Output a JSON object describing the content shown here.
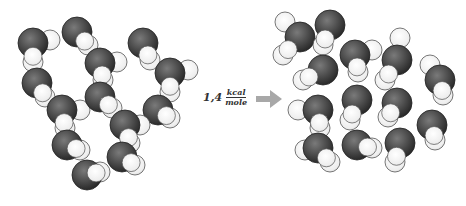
{
  "diagram": {
    "energy_label": {
      "coefficient": "1,4",
      "unit_numerator": "kcal",
      "unit_denominator": "mole"
    },
    "arrow_color": "#9a9a9a",
    "colors": {
      "oxygen_dark": "#3a3a3a",
      "oxygen_mid": "#6a6a6a",
      "hydrogen_fill": "#f2f2f2",
      "outline": "#555555"
    },
    "left_cluster": {
      "name": "ordered-structure",
      "molecules": [
        {
          "o": [
            33,
            43
          ],
          "h": [
            [
              50,
              40
            ],
            [
              33,
              62
            ]
          ]
        },
        {
          "o": [
            77,
            32
          ],
          "h": [
            [
              88,
              45
            ]
          ]
        },
        {
          "o": [
            100,
            63
          ],
          "h": [
            [
              117,
              62
            ],
            [
              103,
              80
            ]
          ]
        },
        {
          "o": [
            143,
            43
          ],
          "h": [
            [
              150,
              60
            ]
          ]
        },
        {
          "o": [
            170,
            73
          ],
          "h": [
            [
              188,
              70
            ],
            [
              170,
              92
            ]
          ]
        },
        {
          "o": [
            37,
            83
          ],
          "h": [
            [
              45,
              97
            ]
          ]
        },
        {
          "o": [
            62,
            110
          ],
          "h": [
            [
              80,
              110
            ],
            [
              65,
              128
            ]
          ]
        },
        {
          "o": [
            100,
            97
          ],
          "h": [
            [
              112,
              108
            ]
          ]
        },
        {
          "o": [
            158,
            110
          ],
          "h": [
            [
              170,
              118
            ]
          ]
        },
        {
          "o": [
            125,
            125
          ],
          "h": [
            [
              140,
              125
            ],
            [
              130,
              143
            ]
          ]
        },
        {
          "o": [
            67,
            145
          ],
          "h": [
            [
              80,
              150
            ]
          ]
        },
        {
          "o": [
            122,
            157
          ],
          "h": [
            [
              135,
              165
            ]
          ]
        },
        {
          "o": [
            87,
            175
          ],
          "h": [
            [
              100,
              172
            ]
          ]
        }
      ]
    },
    "right_cluster": {
      "name": "disordered-structure",
      "molecules": [
        {
          "o": [
            300,
            37
          ],
          "h": [
            [
              285,
              22
            ],
            [
              283,
              55
            ]
          ]
        },
        {
          "o": [
            330,
            25
          ],
          "h": [
            [
              323,
              45
            ]
          ]
        },
        {
          "o": [
            323,
            70
          ],
          "h": [
            [
              303,
              80
            ]
          ]
        },
        {
          "o": [
            355,
            55
          ],
          "h": [
            [
              372,
              50
            ],
            [
              358,
              72
            ]
          ]
        },
        {
          "o": [
            397,
            60
          ],
          "h": [
            [
              400,
              38
            ],
            [
              385,
              80
            ]
          ]
        },
        {
          "o": [
            440,
            80
          ],
          "h": [
            [
              430,
              65
            ],
            [
              443,
              95
            ]
          ]
        },
        {
          "o": [
            318,
            110
          ],
          "h": [
            [
              298,
              110
            ],
            [
              320,
              128
            ]
          ]
        },
        {
          "o": [
            357,
            100
          ],
          "h": [
            [
              350,
              120
            ]
          ]
        },
        {
          "o": [
            397,
            103
          ],
          "h": [
            [
              388,
              117
            ]
          ]
        },
        {
          "o": [
            432,
            125
          ],
          "h": [
            [
              435,
              140
            ]
          ]
        },
        {
          "o": [
            318,
            148
          ],
          "h": [
            [
              305,
              150
            ],
            [
              330,
              162
            ]
          ]
        },
        {
          "o": [
            357,
            145
          ],
          "h": [
            [
              372,
              148
            ]
          ]
        },
        {
          "o": [
            400,
            143
          ],
          "h": [
            [
              395,
              162
            ]
          ]
        }
      ]
    }
  }
}
